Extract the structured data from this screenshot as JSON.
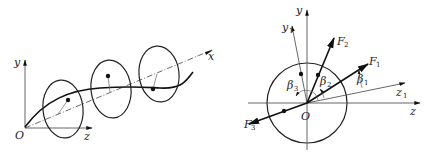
{
  "figures": [
    {
      "id": "left",
      "description": "Rotating shaft with three unbalanced discs, deflection curve along x axis",
      "labels": {
        "y_axis": "y",
        "x_axis": "x",
        "z_axis": "z",
        "origin": "O"
      }
    },
    {
      "id": "right",
      "description": "Cross-section view with forces F1, F2, F3 at angles beta1, beta2, beta3",
      "labels": {
        "y_axis": "y",
        "y1_axis": "y",
        "y1_sub": "1",
        "z_axis": "z",
        "z1_axis": "z",
        "z1_sub": "1",
        "origin": "O",
        "F1": "F",
        "F1_sub": "1",
        "F2": "F",
        "F2_sub": "2",
        "F3": "F",
        "F3_sub": "3",
        "beta1": "β",
        "beta1_sub": "1",
        "beta2": "β",
        "beta2_sub": "2",
        "beta3": "β",
        "beta3_sub": "3"
      }
    }
  ],
  "colors": {
    "line": "#111111",
    "axis": "#555555",
    "background": "#ffffff"
  }
}
